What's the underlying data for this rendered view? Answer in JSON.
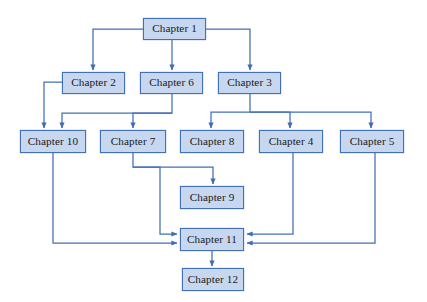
{
  "diagram": {
    "type": "flowchart",
    "orientation": "top-down",
    "style": {
      "node_fill": "#c6d7ef",
      "node_border": "#4270b6",
      "edge_color": "#4270b6",
      "text_color": "#1a1a22",
      "background": "#ffffff"
    },
    "nodes": [
      {
        "id": "ch1",
        "label": "Chapter 1",
        "x": 143,
        "y": 18,
        "w": 63,
        "h": 22
      },
      {
        "id": "ch2",
        "label": "Chapter 2",
        "x": 62,
        "y": 72,
        "w": 63,
        "h": 22
      },
      {
        "id": "ch6",
        "label": "Chapter 6",
        "x": 140,
        "y": 72,
        "w": 63,
        "h": 22
      },
      {
        "id": "ch3",
        "label": "Chapter 3",
        "x": 218,
        "y": 72,
        "w": 63,
        "h": 22
      },
      {
        "id": "ch10",
        "label": "Chapter 10",
        "x": 20,
        "y": 130,
        "w": 66,
        "h": 23
      },
      {
        "id": "ch7",
        "label": "Chapter 7",
        "x": 100,
        "y": 130,
        "w": 66,
        "h": 23
      },
      {
        "id": "ch8",
        "label": "Chapter 8",
        "x": 180,
        "y": 130,
        "w": 64,
        "h": 23
      },
      {
        "id": "ch4",
        "label": "Chapter 4",
        "x": 259,
        "y": 130,
        "w": 64,
        "h": 23
      },
      {
        "id": "ch5",
        "label": "Chapter 5",
        "x": 340,
        "y": 130,
        "w": 64,
        "h": 23
      },
      {
        "id": "ch9",
        "label": "Chapter 9",
        "x": 180,
        "y": 186,
        "w": 64,
        "h": 23
      },
      {
        "id": "ch11",
        "label": "Chapter 11",
        "x": 180,
        "y": 228,
        "w": 64,
        "h": 23
      },
      {
        "id": "ch12",
        "label": "Chapter 12",
        "x": 182,
        "y": 268,
        "w": 62,
        "h": 23
      }
    ],
    "edges": [
      {
        "id": "e1",
        "from": "ch1",
        "to": "ch2",
        "path": "M 174 40 L 174 29 L 93 29 L 93 65 L 93 70",
        "arrow_at": [
          93,
          71
        ]
      },
      {
        "id": "e2",
        "from": "ch1",
        "to": "ch6",
        "path": "M 172 40 L 172 70",
        "arrow_at": [
          172,
          71
        ]
      },
      {
        "id": "e3",
        "from": "ch1",
        "to": "ch3",
        "path": "M 174 29 L 250 29 L 250 70",
        "arrow_at": [
          250,
          71
        ]
      },
      {
        "id": "e4",
        "from": "ch2",
        "to": "ch10",
        "path": "M 62 82 L 44 82 L 44 128",
        "arrow_at": [
          44,
          129
        ]
      },
      {
        "id": "e5",
        "from": "ch6",
        "to": "ch10",
        "path": "M 172 94 L 172 113 L 62 113 L 62 128",
        "arrow_at": [
          62,
          129
        ]
      },
      {
        "id": "e6",
        "from": "ch6",
        "to": "ch7",
        "path": "M 172 113 L 133 113 L 133 128",
        "arrow_at": [
          133,
          129
        ]
      },
      {
        "id": "e7",
        "from": "ch3",
        "to": "ch8",
        "path": "M 250 94 L 250 112 L 211 112 L 211 128",
        "arrow_at": [
          211,
          129
        ]
      },
      {
        "id": "e8",
        "from": "ch3",
        "to": "ch4",
        "path": "M 250 112 L 290 112 L 290 128",
        "arrow_at": [
          290,
          129
        ]
      },
      {
        "id": "e9",
        "from": "ch3",
        "to": "ch5",
        "path": "M 250 112 L 371 112 L 371 128",
        "arrow_at": [
          371,
          129
        ]
      },
      {
        "id": "e10",
        "from": "ch7",
        "to": "ch9",
        "path": "M 133 153 L 133 167 L 213 167 L 213 184",
        "arrow_at": [
          213,
          185
        ]
      },
      {
        "id": "e11",
        "from": "ch7",
        "to": "ch11",
        "path": "M 133 167 L 160 167 L 160 234 L 177 234",
        "arrow_at": [
          178,
          234
        ]
      },
      {
        "id": "e12",
        "from": "ch10",
        "to": "ch11",
        "path": "M 53 153 L 53 243 L 177 243",
        "arrow_at": [
          178,
          243
        ]
      },
      {
        "id": "e13",
        "from": "ch4",
        "to": "ch11",
        "path": "M 293 153 L 293 234 L 247 234",
        "arrow_at": [
          246,
          234
        ]
      },
      {
        "id": "e14",
        "from": "ch5",
        "to": "ch11",
        "path": "M 375 153 L 375 243 L 247 243",
        "arrow_at": [
          246,
          243
        ]
      },
      {
        "id": "e15",
        "from": "ch11",
        "to": "ch12",
        "path": "M 212 251 L 212 266",
        "arrow_at": [
          212,
          267
        ]
      }
    ]
  }
}
